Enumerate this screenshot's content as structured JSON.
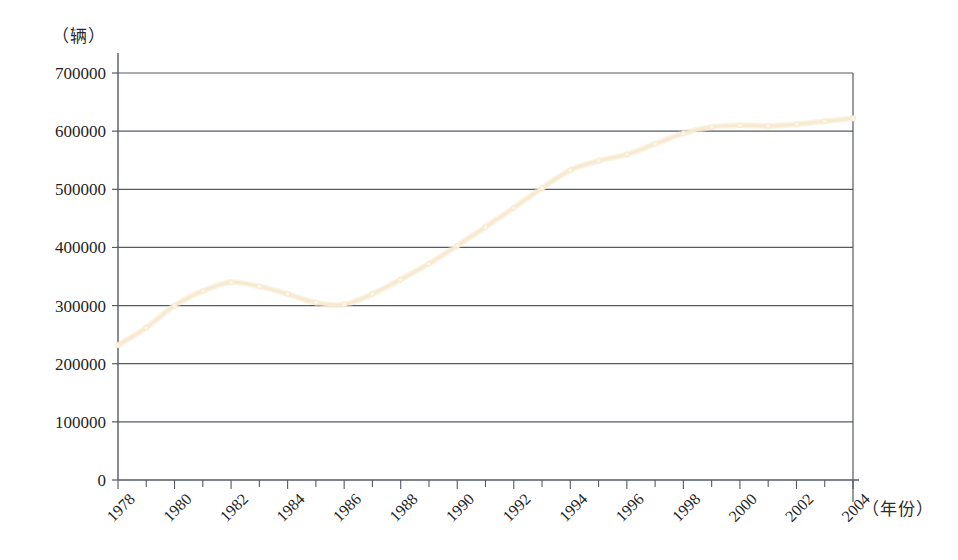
{
  "chart_data": {
    "type": "line",
    "title": "",
    "xlabel": "（年份）",
    "ylabel": "（辆）",
    "xlim": [
      1978,
      2004
    ],
    "ylim": [
      0,
      700000
    ],
    "grid": true,
    "legend": "none",
    "series_color": "#f7ead0",
    "axis_color": "#555a63",
    "x": [
      1978,
      1979,
      1980,
      1981,
      1982,
      1983,
      1984,
      1985,
      1986,
      1987,
      1988,
      1989,
      1990,
      1991,
      1992,
      1993,
      1994,
      1995,
      1996,
      1997,
      1998,
      1999,
      2000,
      2001,
      2002,
      2003,
      2004
    ],
    "values": [
      232000,
      262000,
      300000,
      325000,
      340000,
      333000,
      320000,
      305000,
      302000,
      320000,
      345000,
      372000,
      403000,
      435000,
      468000,
      502000,
      533000,
      549000,
      560000,
      578000,
      596000,
      607000,
      610000,
      609000,
      612000,
      617000,
      622000
    ],
    "y_ticks": [
      0,
      100000,
      200000,
      300000,
      400000,
      500000,
      600000,
      700000
    ],
    "y_tick_labels": [
      "0",
      "100000",
      "200000",
      "300000",
      "400000",
      "500000",
      "600000",
      "700000"
    ],
    "x_tick_labels": [
      "1978",
      "1980",
      "1982",
      "1984",
      "1986",
      "1988",
      "1990",
      "1992",
      "1994",
      "1996",
      "1998",
      "2000",
      "2002",
      "2004"
    ],
    "x_tick_label_years": [
      1978,
      1980,
      1982,
      1984,
      1986,
      1988,
      1990,
      1992,
      1994,
      1996,
      1998,
      2000,
      2002,
      2004
    ],
    "x_minor_years": [
      1979,
      1981,
      1983,
      1985,
      1987,
      1989,
      1991,
      1993,
      1995,
      1997,
      1999,
      2001,
      2003
    ]
  }
}
